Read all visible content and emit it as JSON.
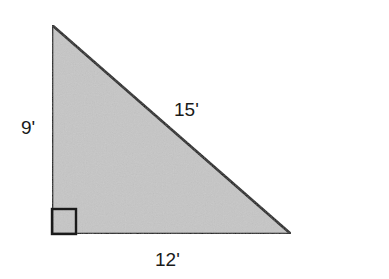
{
  "diagram": {
    "type": "right-triangle",
    "fill_color": "#c6c6c6",
    "stroke_color": "#1a1a1a",
    "vertices": {
      "top": [
        52,
        25
      ],
      "right_angle": [
        52,
        234
      ],
      "right": [
        291,
        234
      ]
    },
    "right_angle_marker": true,
    "labels": {
      "vertical_leg": "9'",
      "hypotenuse": "15'",
      "horizontal_leg": "12'"
    }
  }
}
